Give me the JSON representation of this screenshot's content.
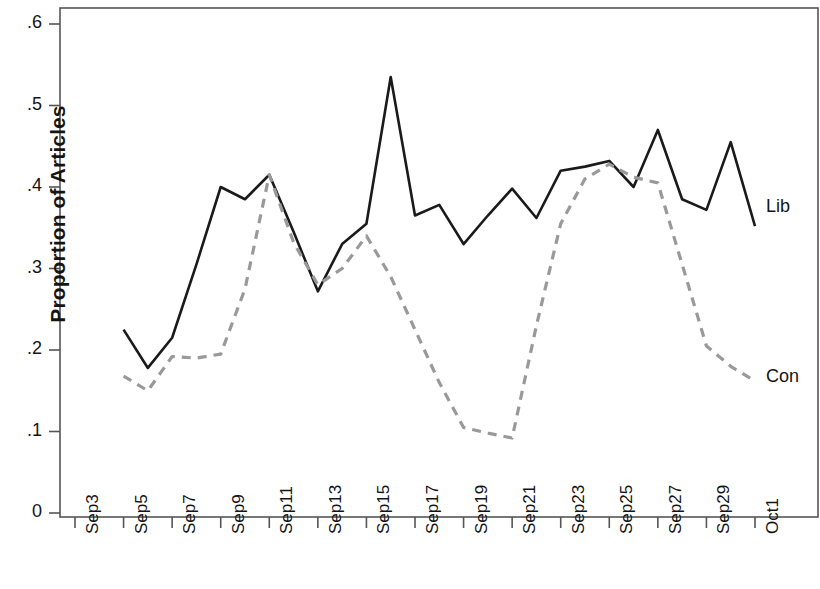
{
  "chart_data": {
    "type": "line",
    "title": "",
    "xlabel": "",
    "ylabel": "Proportion of Articles",
    "ylim": [
      0,
      0.6
    ],
    "yticks": [
      "0",
      ".1",
      ".2",
      ".3",
      ".4",
      ".5",
      ".6"
    ],
    "ytick_values": [
      0,
      0.1,
      0.2,
      0.3,
      0.4,
      0.5,
      0.6
    ],
    "grid": false,
    "legend_position": "right-inline",
    "x": [
      "Sep3",
      "Sep4",
      "Sep5",
      "Sep6",
      "Sep7",
      "Sep8",
      "Sep9",
      "Sep10",
      "Sep11",
      "Sep12",
      "Sep13",
      "Sep14",
      "Sep15",
      "Sep16",
      "Sep17",
      "Sep18",
      "Sep19",
      "Sep20",
      "Sep21",
      "Sep22",
      "Sep23",
      "Sep24",
      "Sep25",
      "Sep26",
      "Sep27",
      "Sep28",
      "Sep29",
      "Sep30",
      "Oct1"
    ],
    "xticks": [
      "Sep3",
      "Sep5",
      "Sep7",
      "Sep9",
      "Sep11",
      "Sep13",
      "Sep15",
      "Sep17",
      "Sep19",
      "Sep21",
      "Sep23",
      "Sep25",
      "Sep27",
      "Sep29",
      "Oct1"
    ],
    "xtick_values": [
      0,
      2,
      4,
      6,
      8,
      10,
      12,
      14,
      16,
      18,
      20,
      22,
      24,
      26,
      28
    ],
    "series": [
      {
        "name": "Lib",
        "style": "solid",
        "color": "#1a1a1a",
        "start_index": 2,
        "values": [
          null,
          null,
          0.225,
          0.178,
          0.215,
          0.305,
          0.4,
          0.385,
          0.415,
          0.345,
          0.272,
          0.33,
          0.355,
          0.535,
          0.365,
          0.378,
          0.33,
          0.365,
          0.398,
          0.362,
          0.42,
          0.425,
          0.432,
          0.4,
          0.47,
          0.385,
          0.372,
          0.455,
          0.352
        ]
      },
      {
        "name": "Con",
        "style": "dashed",
        "color": "#999999",
        "start_index": 2,
        "values": [
          null,
          null,
          0.168,
          0.15,
          0.192,
          0.19,
          0.195,
          0.275,
          0.415,
          0.332,
          0.28,
          0.3,
          0.34,
          0.29,
          0.225,
          0.16,
          0.105,
          0.098,
          0.092,
          0.23,
          0.355,
          0.41,
          0.428,
          0.412,
          0.405,
          0.305,
          0.205,
          0.18,
          0.162
        ]
      }
    ],
    "annotations": [
      {
        "text": "Lib",
        "x": 766,
        "y": 196
      },
      {
        "text": "Con",
        "x": 766,
        "y": 366
      }
    ]
  },
  "plot_frame": {
    "left": 60,
    "right": 818,
    "top": 8,
    "bottom": 517
  }
}
